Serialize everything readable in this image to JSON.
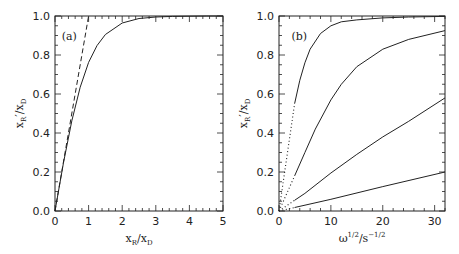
{
  "chart_data": [
    {
      "type": "line",
      "panel_label": "(a)",
      "title": "",
      "xlabel": "x_R/x_D",
      "ylabel": "x_R'/x_D",
      "xlim": [
        0,
        5
      ],
      "ylim": [
        0,
        1
      ],
      "xticks": [
        "0",
        "1",
        "2",
        "3",
        "4",
        "5"
      ],
      "yticks": [
        "0.0",
        "0.2",
        "0.4",
        "0.6",
        "0.8",
        "1.0"
      ],
      "grid": false,
      "series": [
        {
          "name": "solid curve",
          "style": "solid",
          "x": [
            0,
            0.25,
            0.5,
            0.75,
            1.0,
            1.25,
            1.5,
            2.0,
            2.5,
            3.0,
            3.5,
            4.0,
            4.5,
            5.0
          ],
          "y": [
            0,
            0.245,
            0.462,
            0.635,
            0.762,
            0.848,
            0.905,
            0.964,
            0.987,
            0.995,
            0.998,
            0.999,
            1.0,
            1.0
          ]
        },
        {
          "name": "dashed line (y = x)",
          "style": "dashed",
          "x": [
            0,
            1.0
          ],
          "y": [
            0,
            1.0
          ]
        }
      ]
    },
    {
      "type": "line",
      "panel_label": "(b)",
      "title": "",
      "xlabel": "ω^(1/2)/s^(-1/2)",
      "ylabel": "x_R'/x_D",
      "xlim": [
        0,
        32
      ],
      "ylim": [
        0,
        1
      ],
      "xticks": [
        "0",
        "10",
        "20",
        "30"
      ],
      "yticks": [
        "0.0",
        "0.2",
        "0.4",
        "0.6",
        "0.8",
        "1.0"
      ],
      "grid": false,
      "series": [
        {
          "name": "curve 1 (top)",
          "style": "dotted below x=3, solid above",
          "x": [
            0,
            3,
            4,
            5,
            6,
            8,
            10,
            12,
            15,
            20,
            25,
            32
          ],
          "y": [
            0,
            0.55,
            0.67,
            0.76,
            0.83,
            0.91,
            0.95,
            0.97,
            0.98,
            0.99,
            0.995,
            0.998
          ]
        },
        {
          "name": "curve 2",
          "style": "dotted below x=3, solid above",
          "x": [
            0,
            3,
            5,
            7,
            10,
            12,
            15,
            20,
            25,
            32
          ],
          "y": [
            0,
            0.18,
            0.3,
            0.42,
            0.57,
            0.65,
            0.74,
            0.83,
            0.88,
            0.925
          ]
        },
        {
          "name": "curve 3",
          "style": "dotted below x=3, solid above",
          "x": [
            0,
            3,
            5,
            10,
            15,
            20,
            25,
            32
          ],
          "y": [
            0,
            0.055,
            0.09,
            0.195,
            0.29,
            0.38,
            0.46,
            0.58
          ]
        },
        {
          "name": "curve 4 (bottom)",
          "style": "dotted below x=3, solid above",
          "x": [
            0,
            3,
            10,
            20,
            32
          ],
          "y": [
            0,
            0.018,
            0.06,
            0.125,
            0.2
          ]
        }
      ]
    }
  ]
}
